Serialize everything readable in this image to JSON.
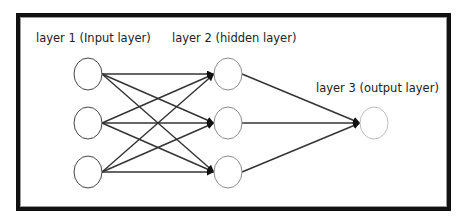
{
  "diagram": {
    "type": "neural-network",
    "layers": [
      {
        "label": "layer 1 (Input layer)",
        "node_count": 3
      },
      {
        "label": "layer 2 (hidden layer)",
        "node_count": 3
      },
      {
        "label": "layer 3 (output layer)",
        "node_count": 1
      }
    ],
    "connections": "fully-connected, directed left to right",
    "colors": {
      "frame": "#111111",
      "edge": "#333333",
      "input_node_stroke": "#444444",
      "hidden_node_stroke": "#8a8a8a",
      "output_node_stroke": "#bdbdbd"
    }
  }
}
